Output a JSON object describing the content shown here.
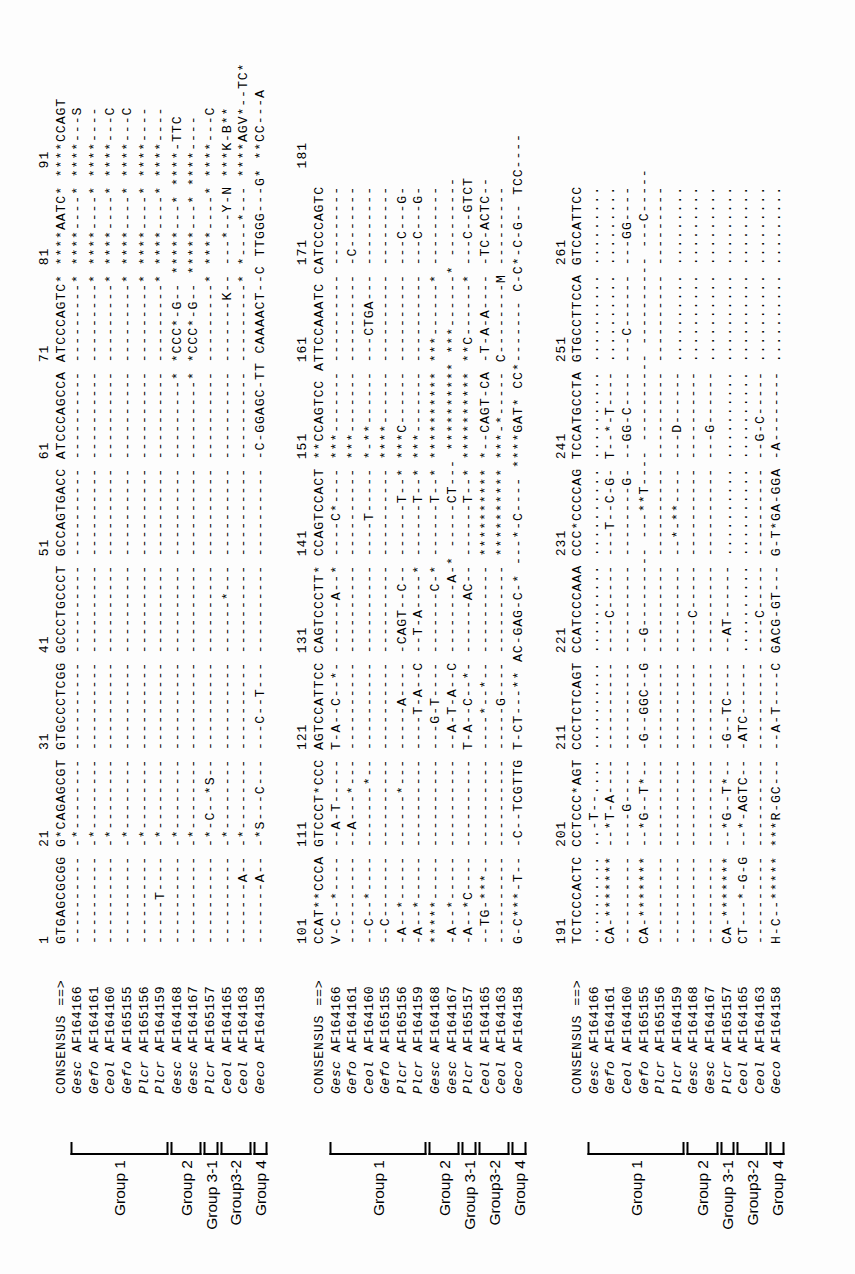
{
  "figure": {
    "type": "multiple-sequence-alignment",
    "orientation": "rotated-90-ccw",
    "consensus_label": "CONSENSUS ==>",
    "taxa": [
      {
        "genus_code": "Gesc",
        "accession": "AF164166"
      },
      {
        "genus_code": "Gefo",
        "accession": "AF164161"
      },
      {
        "genus_code": "Ceol",
        "accession": "AF164160"
      },
      {
        "genus_code": "Gefo",
        "accession": "AF165155"
      },
      {
        "genus_code": "Plcr",
        "accession": "AF165156"
      },
      {
        "genus_code": "Plcr",
        "accession": "AF164159"
      },
      {
        "genus_code": "Gesc",
        "accession": "AF164168"
      },
      {
        "genus_code": "Gesc",
        "accession": "AF164167"
      },
      {
        "genus_code": "Plcr",
        "accession": "AF165157"
      },
      {
        "genus_code": "Ceol",
        "accession": "AF164165"
      },
      {
        "genus_code": "Ceol",
        "accession": "AF164163"
      },
      {
        "genus_code": "Geco",
        "accession": "AF164158"
      }
    ],
    "groups": [
      {
        "label": "Group 1",
        "first_row": 0,
        "last_row": 5
      },
      {
        "label": "Group 2",
        "first_row": 6,
        "last_row": 7
      },
      {
        "label": "Group 3-1",
        "first_row": 8,
        "last_row": 8
      },
      {
        "label": "Group3-2",
        "first_row": 9,
        "last_row": 10
      },
      {
        "label": "Group 4",
        "first_row": 11,
        "last_row": 11
      }
    ],
    "blocks": [
      {
        "ruler": "1          21         31         41         51         61         71         81         91",
        "ruler_ticks": [
          "1",
          "21",
          "31",
          "41",
          "51",
          "61",
          "71",
          "81",
          "91"
        ],
        "consensus": "GTGAGCGCGG G*CAGAGCGT GTGCCCTCGG GCCCTGCCCT GCCAGTGACC ATCCCAGCCA ATCCCAGTC* ****AATC* ****CCAGT",
        "rows": [
          "---------- -*-------- ---------- ---------- ---------- ---------- ---------* ****----* ****---S",
          "---------- -*-------- ---------- ---------- ---------- ---------- ---------* ****----* ****----",
          "---------- -*-------- ---------- ---------- ---------- ---------- ---------* ****----* ****---C",
          "---------- -*-------- ---------- ---------- ---------- ---------- ---------* ****----* ****---C",
          "---------- -*-------- ---------- ---------- ---------- ---------- ---------* ****----* ****----",
          "-----T---- -*-------- ---------- ---------- ---------- ---------- ---------* ****----* ****----",
          "---------- -*-------- ---------- ---------- ---------- ---------* *CCC*-G-- *****---* ****-TTC",
          "---------- -*-------- ---------- ---------- ---------- ---------* *CCC*-G-- *****---* ****----",
          "---------- -*-C--*S-- ---------- ---------- ---------- ---------- ---------* ****----* ****---C",
          "---------- -*-------- ---------- ------*--- ---------- ---------- -------K-- ---*--Y-N ***K-B**",
          "-------A-- -*-------- ---------- ---------- ---------- ---------- ---------* *----*--- ****AGV*--TC*",
          "-------A-- -*S---C--- ---C--T--- ---------- ---------- -C-GGAGC-TT CAAAACT--C TTGGG---G* **CC---A"
        ]
      },
      {
        "ruler": "101        111        121        131        141        151        161        171        181",
        "ruler_ticks": [
          "101",
          "111",
          "121",
          "131",
          "141",
          "151",
          "161",
          "171",
          "181"
        ],
        "consensus": "CCAT**CCCA GTCCCT*CCC AGTCCATTCC CAGTCCCTT* CCAGTCCACT **CCAGTCC ATTCCAAATC CATCCCAGTC",
        "rows": [
          "V-C--*---- --A-T----- T-A--C--*- ------A--* ----C*---- ***------- ---------- ---------",
          "---------- --A---*--- ---------- ---------- ---------- ***------- ---------- -C-------",
          "--C--*---- -------*-- ---------- ---------- ----T----- *-**------ ---CTGA--- ---------",
          "--C------- ---------- ---------- ---------- ---------- ****------ ---------- ---------",
          "-A--*----- ------*--- -----A---- -CAGT--C-- ------T--* ***C------ ---------- ---C---G-",
          "-A--*----- ---------- ----T-A--C --T-A----* ------T--* ***------- ---------- ---C---G-",
          "*****----- ---------- ---G-T---- -------C-* ------T--* ********** ***------* ---------",
          "-A--*----- ---------- --A-T-A--C --------A-* -----CT--- ********** ***------* ---------",
          "-A--*C---- ---------- T-A--C--*- ------AC-- ------T--* ********** **C------* ---C--GTCT",
          "--TG-***-- ---------- ----*--*-- ---------- ********** *--CAGT-CA -T-A-A---- -TC-ACTC--",
          "---------- ---------- -----G---- ---------- ********** ***-*----- C--------M ---------",
          "G-C***-T-- -C--TCGTTG T-CT---** AC-GAG-C-* ---*-C---- ****GAT* CC*------- C-C*-C-G-- TCC----"
        ]
      },
      {
        "ruler": "191        201        211        221        231        241        251        261",
        "ruler_ticks": [
          "191",
          "201",
          "211",
          "221",
          "231",
          "241",
          "251",
          "261"
        ],
        "consensus": "TCTCCCACTC CCTCCC*AGT CCCTCTCAGT CCATCCCAAA CCC*CCCCAG TCCATGCCTA GTGCCTTCCA GTCCATTCC",
        "rows": [
          ".......... ..-T--.... .......... .......... .......... .......... .......... .........",
          "CA-******* --*T-A---- ---------- ----C----- ---T--C-G- T--*-T---- .......... .........",
          "---------- ----G----- ---------- ---------- --------G- --GG-C---- ---C------ ---GG----",
          "CA-******* --*G--T*-- -G--GGC--G --G--------- ---**T---- ---------- ---------- ---C-----",
          "---------- ---------- ---------- ---------- ---------- ---------- ---------- ---------",
          "---------- ---------- ---------- ---------- --*-**---- ---D------ .......... .........",
          "---------- ---------- ---------- ----C----- ---------- ---------- .......... .........",
          "---------- ---------- ---------- ---------- ---------- ---G------ .......... .........",
          "CA-******* --*G--T*-- -G--TC---- --AT------ .......... .......... .......... .........",
          "CT---*-G-G --*-AGTC-- -ATC------ .......... .......... .......... .......... .........",
          "---------- ---------- ---------- ----C----- ---------- --G-C----- .......... .........",
          "H-C--***** ***R-GC--- --A-T----C GACG-GT--- G-T*GA-GGA -A-------- .......... ........."
        ]
      }
    ]
  }
}
